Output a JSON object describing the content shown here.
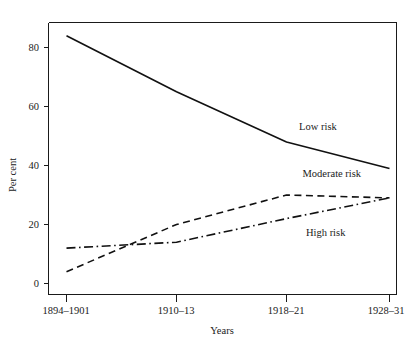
{
  "chart_data": {
    "type": "line",
    "title": "",
    "subtitle": "",
    "xlabel": "Years",
    "ylabel": "Per cent",
    "categories": [
      "1894–1901",
      "1910–13",
      "1918–21",
      "1928–31"
    ],
    "x_tick_labels": [
      "1894–1901",
      "1910–13",
      "1918–21",
      "1928–31"
    ],
    "y_tick_labels": [
      "0",
      "20",
      "40",
      "60",
      "80"
    ],
    "y_ticks": [
      0,
      20,
      40,
      60,
      80
    ],
    "ylim": [
      -3,
      92
    ],
    "xlim": [
      0,
      3
    ],
    "grid": false,
    "legend_position": "inline-annotations",
    "series": [
      {
        "name": "Low risk",
        "label": "Low risk",
        "style": "solid",
        "color": "#111111",
        "values": [
          84,
          65,
          48,
          39
        ]
      },
      {
        "name": "Moderate risk",
        "label": "Moderate risk",
        "style": "dashed",
        "color": "#111111",
        "values": [
          4,
          20,
          30,
          29
        ]
      },
      {
        "name": "High risk",
        "label": "High risk",
        "style": "dash-dot",
        "color": "#111111",
        "values": [
          12,
          14,
          22,
          29
        ]
      }
    ],
    "annotations": [
      {
        "text": "Low risk",
        "x_frac": 0.72,
        "value": 53
      },
      {
        "text": "Moderate risk",
        "x_frac": 0.73,
        "value": 37
      },
      {
        "text": "High risk",
        "x_frac": 0.74,
        "value": 17
      }
    ]
  },
  "axes": {
    "y_title": "Per cent",
    "x_title": "Years",
    "y_tick_0": "0",
    "y_tick_20": "20",
    "y_tick_40": "40",
    "y_tick_60": "60",
    "y_tick_80": "80",
    "x_tick_0": "1894–1901",
    "x_tick_1": "1910–13",
    "x_tick_2": "1918–21",
    "x_tick_3": "1928–31"
  },
  "labels": {
    "low_risk": "Low risk",
    "moderate_risk": "Moderate risk",
    "high_risk": "High risk"
  }
}
